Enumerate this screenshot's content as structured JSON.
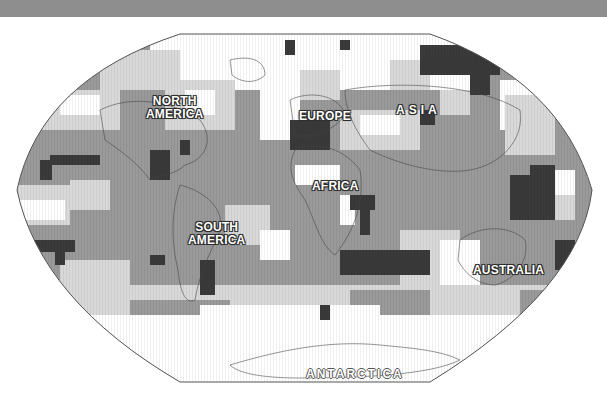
{
  "map": {
    "projection": "Robinson-style world map",
    "tones": {
      "white": "#ffffff",
      "light": "#d9d9d9",
      "medium": "#9a9a9a",
      "dark": "#3a3a3a",
      "outline": "#444444",
      "band": "#8e8e8e"
    },
    "labels": [
      {
        "id": "north-america",
        "lines": [
          "NORTH",
          "AMERICA"
        ]
      },
      {
        "id": "europe",
        "lines": [
          "EUROPE"
        ]
      },
      {
        "id": "asia",
        "lines": [
          "ASIA"
        ]
      },
      {
        "id": "africa",
        "lines": [
          "AFRICA"
        ]
      },
      {
        "id": "south-america",
        "lines": [
          "SOUTH",
          "AMERICA"
        ]
      },
      {
        "id": "australia",
        "lines": [
          "AUSTRALIA"
        ]
      },
      {
        "id": "antarctica",
        "lines": [
          "ANTARCTICA"
        ]
      }
    ]
  }
}
